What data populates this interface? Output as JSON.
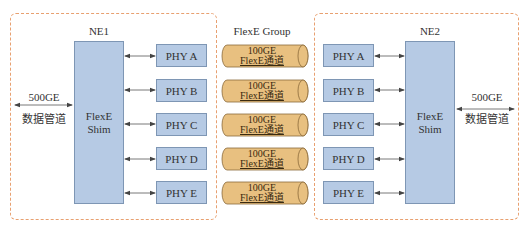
{
  "group": {
    "title": "FlexE Group",
    "channels": [
      {
        "line1": "100GE",
        "line2": "FlexE通道"
      },
      {
        "line1": "100GE",
        "line2": "FlexE通道"
      },
      {
        "line1": "100GE",
        "line2": "FlexE通道"
      },
      {
        "line1": "100GE",
        "line2": "FlexE通道"
      },
      {
        "line1": "100GE",
        "line2": "FlexE通道"
      }
    ],
    "pipe_color": "#e8c080"
  },
  "ne1": {
    "title": "NE1",
    "shim_line1": "FlexE",
    "shim_line2": "Shim",
    "client_rate": "500GE",
    "client_label": "数据管道",
    "phys": [
      "PHY A",
      "PHY B",
      "PHY C",
      "PHY D",
      "PHY E"
    ]
  },
  "ne2": {
    "title": "NE2",
    "shim_line1": "FlexE",
    "shim_line2": "Shim",
    "client_rate": "500GE",
    "client_label": "数据管道",
    "phys": [
      "PHY A",
      "PHY B",
      "PHY C",
      "PHY D",
      "PHY E"
    ]
  },
  "colors": {
    "frame_border": "#e8a070",
    "box_fill": "#b6cae4",
    "box_border": "#7e96b4",
    "arrow": "#444444"
  }
}
